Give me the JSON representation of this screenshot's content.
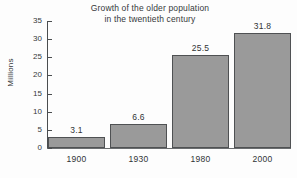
{
  "chart_data": {
    "type": "bar",
    "title": "Growth of the older population\nin the twentieth century",
    "xlabel": "",
    "ylabel": "Millions",
    "categories": [
      "1900",
      "1930",
      "1980",
      "2000"
    ],
    "values": [
      3.1,
      6.6,
      25.5,
      31.8
    ],
    "value_labels": [
      "3.1",
      "6.6",
      "25.5",
      "31.8"
    ],
    "ylim": [
      0,
      35
    ],
    "yticks": [
      0,
      5,
      10,
      15,
      20,
      25,
      30,
      35
    ],
    "ytick_labels": [
      "0",
      "5",
      "10",
      "15",
      "20",
      "25",
      "30",
      "35"
    ],
    "grid": false,
    "legend": null,
    "colors": {
      "bar_fill": "#9a9a9a",
      "bar_border": "#4f5153",
      "axis": "#4a4d4f",
      "text": "#303335",
      "background": "#fdfdfd"
    }
  }
}
